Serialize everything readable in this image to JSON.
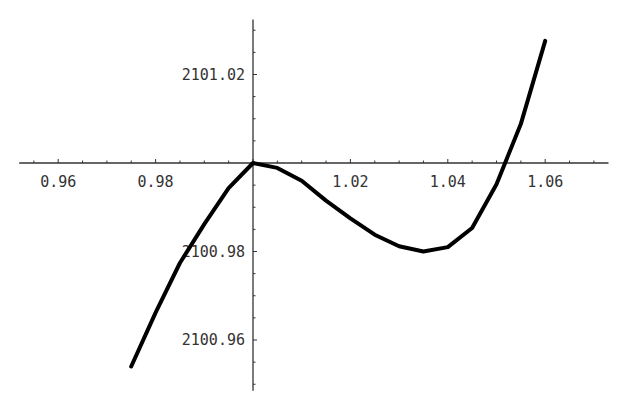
{
  "chart_data": {
    "type": "line",
    "title": "",
    "xlabel": "",
    "ylabel": "",
    "xlim": [
      0.952,
      1.073
    ],
    "ylim": [
      2100.949,
      2101.032
    ],
    "x_ticks": [
      0.96,
      0.98,
      1.02,
      1.04,
      1.06
    ],
    "x_tick_labels": [
      "0.96",
      "0.98",
      "1.02",
      "1.04",
      "1.06"
    ],
    "y_ticks": [
      2101.02,
      2100.98,
      2100.96
    ],
    "y_tick_labels": [
      "2101.02",
      "2100.98",
      "2100.96"
    ],
    "axes_origin": {
      "x": 1.0,
      "y": 2101.0
    },
    "grid": false,
    "legend": null,
    "series": [
      {
        "name": "f(x)",
        "x": [
          0.975,
          0.98,
          0.985,
          0.99,
          0.995,
          1.0,
          1.005,
          1.01,
          1.015,
          1.02,
          1.025,
          1.03,
          1.035,
          1.04,
          1.045,
          1.05,
          1.055,
          1.06
        ],
        "values": [
          2100.954,
          2100.9662,
          2100.9774,
          2100.9862,
          2100.9943,
          2101.0,
          2100.9989,
          2100.996,
          2100.9915,
          2100.9875,
          2100.9838,
          2100.9812,
          2100.98,
          2100.981,
          2100.9853,
          2100.9952,
          2101.0088,
          2101.0276
        ]
      }
    ],
    "annotations": []
  }
}
